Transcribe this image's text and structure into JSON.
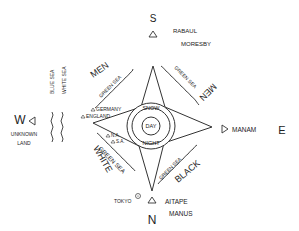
{
  "directions": {
    "south": "S",
    "north": "N",
    "west": "W",
    "east": "E"
  },
  "places": {
    "rabaul": "RABAUL",
    "moresby": "MORESBY",
    "manam": "MANAM",
    "aitape": "AITAPE",
    "manus": "MANUS",
    "tokyo": "TOKYO",
    "germany": "GERMANY",
    "england": "ENGLAND",
    "usa_na": "N.A.",
    "usa_sa": "S.A.",
    "unknown_land_1": "UNKNOWN",
    "unknown_land_2": "LAND"
  },
  "seas": {
    "blue_sea": "BLUE SEA",
    "white_sea": "WHITE SEA",
    "green_sea_nw": "GREEN SEA",
    "green_sea_ne": "GREEN SEA",
    "green_sea_sw": "GREEN SEA",
    "green_sea_se": "GREEN SEA"
  },
  "peoples": {
    "men_nw": "MEN",
    "men_ne": "MEN",
    "white": "WHITE",
    "black": "BLACK"
  },
  "center": {
    "snow": "SNOW",
    "day": "DAY",
    "night": "NIGHT"
  },
  "colors": {
    "ink": "#222222",
    "background": "#ffffff"
  }
}
